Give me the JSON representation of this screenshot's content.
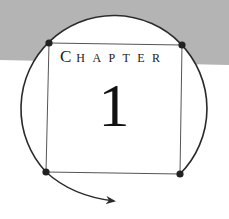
{
  "chapter": {
    "label_initial": "C",
    "label_rest": "HAPTER",
    "number": "1"
  },
  "colors": {
    "band_gray": "#b4b4b4",
    "line": "#2a2a2a",
    "text": "#111111"
  }
}
